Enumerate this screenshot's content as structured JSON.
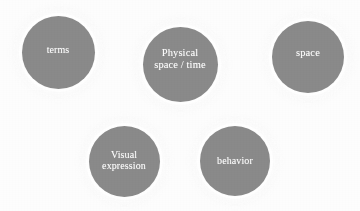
{
  "diagram": {
    "background_color": "#fdfdfd",
    "node_fill_color": "#8a8a8a",
    "node_text_color": "#ffffff",
    "halo_color": "#ffffff",
    "nodes": [
      {
        "id": "terms",
        "label": "terms",
        "shape": "circle",
        "center_x": 58,
        "center_y": 52,
        "diameter": 73,
        "font_size": 10,
        "text_offset_y": -2,
        "row": "top"
      },
      {
        "id": "physical-space-time",
        "label": "Physical\nspace / time",
        "shape": "circle",
        "center_x": 180,
        "center_y": 64,
        "diameter": 75,
        "font_size": 10.5,
        "text_offset_y": -5,
        "row": "top"
      },
      {
        "id": "space",
        "label": "space",
        "shape": "circle",
        "center_x": 308,
        "center_y": 57,
        "diameter": 72,
        "font_size": 10.5,
        "text_offset_y": -4,
        "row": "top"
      },
      {
        "id": "visual-expression",
        "label": "Visual\nexpression",
        "shape": "circle",
        "center_x": 124,
        "center_y": 161,
        "diameter": 71,
        "font_size": 10,
        "text_offset_y": -1,
        "row": "bottom"
      },
      {
        "id": "behavior",
        "label": "behavior",
        "shape": "circle",
        "center_x": 235,
        "center_y": 161,
        "diameter": 70,
        "font_size": 10,
        "text_offset_y": 0,
        "row": "bottom"
      }
    ]
  }
}
